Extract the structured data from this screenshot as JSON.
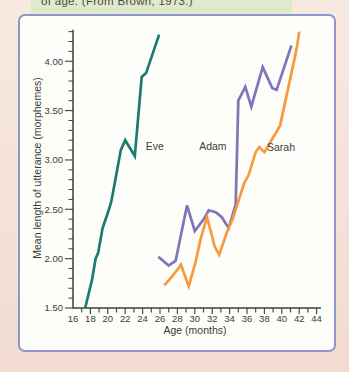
{
  "caption": {
    "text": "of age. (From Brown, 1973.)"
  },
  "chart_data": {
    "type": "line",
    "title": "",
    "xlabel": "Age (months)",
    "ylabel": "Mean length of utterance (morphemes)",
    "xlim": [
      16,
      44.5
    ],
    "ylim": [
      1.5,
      4.32
    ],
    "grid": false,
    "legend_position": "inline-labels",
    "x_ticks": {
      "labeled_values": [
        16,
        18,
        20,
        22,
        24,
        26,
        28,
        30,
        32,
        34,
        36,
        38,
        40,
        42,
        44
      ],
      "minor_step": 1
    },
    "y_ticks": {
      "labeled_values": [
        1.5,
        2.0,
        2.5,
        3.0,
        3.5,
        4.0
      ],
      "labels": [
        "1.50",
        "2.00",
        "2.50",
        "3.00",
        "3.50",
        "4.00"
      ],
      "minor_step": 0.1,
      "minor_max": 4.3
    },
    "series": [
      {
        "name": "Eve",
        "color": "#1b7b70",
        "label": {
          "text": "Eve",
          "x": 24.35,
          "y": 3.1
        },
        "points": [
          [
            17.4,
            1.5
          ],
          [
            18.2,
            1.79
          ],
          [
            18.6,
            2.0
          ],
          [
            18.9,
            2.06
          ],
          [
            19.4,
            2.31
          ],
          [
            20.1,
            2.49
          ],
          [
            20.4,
            2.58
          ],
          [
            20.8,
            2.77
          ],
          [
            21.5,
            3.1
          ],
          [
            22.0,
            3.2
          ],
          [
            23.1,
            3.04
          ],
          [
            23.9,
            3.84
          ],
          [
            24.4,
            3.88
          ],
          [
            25.9,
            4.27
          ]
        ]
      },
      {
        "name": "Adam",
        "color": "#8374ba",
        "label": {
          "text": "Adam",
          "x": 30.5,
          "y": 3.105
        },
        "points": [
          [
            25.8,
            2.02
          ],
          [
            27.0,
            1.93
          ],
          [
            27.8,
            1.98
          ],
          [
            29.1,
            2.54
          ],
          [
            30.0,
            2.28
          ],
          [
            31.1,
            2.41
          ],
          [
            31.6,
            2.49
          ],
          [
            32.4,
            2.47
          ],
          [
            33.1,
            2.42
          ],
          [
            33.9,
            2.31
          ],
          [
            34.7,
            2.55
          ],
          [
            35.0,
            3.6
          ],
          [
            35.8,
            3.74
          ],
          [
            36.5,
            3.54
          ],
          [
            37.8,
            3.94
          ],
          [
            38.9,
            3.73
          ],
          [
            39.4,
            3.71
          ],
          [
            41.1,
            4.16
          ]
        ]
      },
      {
        "name": "Sarah",
        "color": "#f59b3b",
        "label": {
          "text": "Sarah",
          "x": 38.3,
          "y": 3.09
        },
        "points": [
          [
            26.5,
            1.73
          ],
          [
            27.3,
            1.81
          ],
          [
            28.2,
            1.91
          ],
          [
            28.4,
            1.94
          ],
          [
            29.3,
            1.72
          ],
          [
            30.1,
            1.97
          ],
          [
            30.7,
            2.21
          ],
          [
            31.4,
            2.42
          ],
          [
            32.3,
            2.12
          ],
          [
            32.8,
            2.04
          ],
          [
            33.7,
            2.27
          ],
          [
            34.3,
            2.39
          ],
          [
            35.7,
            2.77
          ],
          [
            36.2,
            2.85
          ],
          [
            37.0,
            3.08
          ],
          [
            37.4,
            3.13
          ],
          [
            38.0,
            3.08
          ],
          [
            38.8,
            3.2
          ],
          [
            39.3,
            3.27
          ],
          [
            39.8,
            3.35
          ],
          [
            41.6,
            4.08
          ],
          [
            41.8,
            4.18
          ],
          [
            42.0,
            4.3
          ]
        ]
      }
    ]
  },
  "colors": {
    "page_bg_top": "#f8e9e0",
    "page_bg_bottom": "#f1dbd0",
    "panel_border": "#8e96cc",
    "panel_bg": "#fdfdfa",
    "highlight_bg": "#e0e9cb",
    "axis": "#3f3f3b",
    "text": "#3c3c38"
  }
}
